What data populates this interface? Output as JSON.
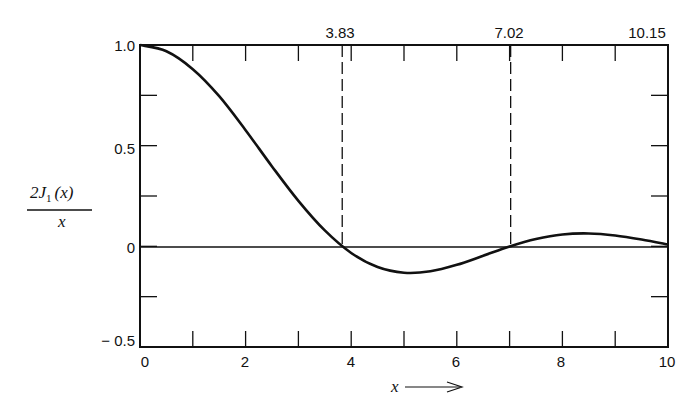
{
  "chart_data": {
    "type": "line",
    "title": "",
    "xlabel": "x",
    "ylabel": "2J1(x)/x",
    "xlim": [
      0,
      10
    ],
    "ylim": [
      -0.5,
      1.0
    ],
    "x_ticks": [
      "0",
      "2",
      "4",
      "6",
      "8",
      "10"
    ],
    "y_ticks": [
      "1.0",
      "0.5",
      "0",
      "-0.5"
    ],
    "top_annotations": [
      "3.83",
      "7.02",
      "10.15"
    ],
    "zero_markers": [
      3.83,
      7.02
    ],
    "grid": false,
    "series": [
      {
        "name": "2J1(x)/x",
        "x": [
          0,
          0.5,
          1,
          1.5,
          2,
          2.5,
          3,
          3.5,
          4,
          4.5,
          5,
          5.5,
          6,
          6.5,
          7,
          7.5,
          8,
          8.5,
          9,
          9.5,
          10
        ],
        "values": [
          1.0,
          0.969,
          0.88,
          0.746,
          0.577,
          0.397,
          0.226,
          0.079,
          -0.033,
          -0.103,
          -0.131,
          -0.124,
          -0.092,
          -0.047,
          -0.001,
          0.036,
          0.059,
          0.064,
          0.054,
          0.034,
          0.009
        ]
      }
    ]
  },
  "labels": {
    "ylabel_num": "2J",
    "ylabel_sub": "1",
    "ylabel_arg": "(x)",
    "ylabel_den": "x",
    "xlabel": "x",
    "x_ticks": [
      "0",
      "2",
      "4",
      "6",
      "8",
      "10"
    ],
    "y_ticks": [
      "1.0",
      "0.5",
      "0",
      "− 0.5"
    ],
    "top": [
      "3.83",
      "7.02",
      "10.15"
    ]
  }
}
